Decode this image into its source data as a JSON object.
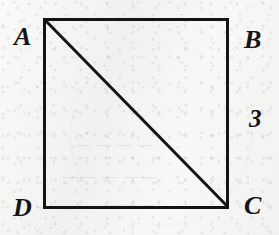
{
  "figure": {
    "kind": "geometry-diagram",
    "background_color": "#f4f4f3",
    "ink_color": "#141414",
    "square": {
      "x": 43,
      "y": 18,
      "width": 186,
      "height": 191,
      "stroke_width": 3
    },
    "diagonal": {
      "from": "A",
      "to": "C",
      "x1": 45,
      "y1": 20,
      "x2": 228,
      "y2": 207,
      "stroke_width": 3
    },
    "vertices": [
      {
        "id": "A",
        "label": "A",
        "position": "top-left"
      },
      {
        "id": "B",
        "label": "B",
        "position": "top-right"
      },
      {
        "id": "C",
        "label": "C",
        "position": "bottom-right"
      },
      {
        "id": "D",
        "label": "D",
        "position": "bottom-left"
      }
    ],
    "measurements": [
      {
        "side": "BC",
        "label": "3",
        "position": "right"
      }
    ],
    "bleed_through_text": [
      "— — — —",
      "—— — ——",
      "— — —"
    ]
  }
}
